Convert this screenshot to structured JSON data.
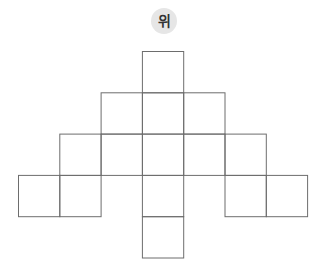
{
  "label": {
    "text": "위",
    "background": "#e6e6e6",
    "color": "#333333"
  },
  "grid": {
    "origin_x": 18.5,
    "origin_y": 51.5,
    "cell_size": 41.3,
    "stroke": "#6d6d6d",
    "cells": [
      {
        "row": 0,
        "col": 3
      },
      {
        "row": 1,
        "col": 2
      },
      {
        "row": 1,
        "col": 3
      },
      {
        "row": 1,
        "col": 4
      },
      {
        "row": 2,
        "col": 1
      },
      {
        "row": 2,
        "col": 2
      },
      {
        "row": 2,
        "col": 3
      },
      {
        "row": 2,
        "col": 4
      },
      {
        "row": 2,
        "col": 5
      },
      {
        "row": 3,
        "col": 0
      },
      {
        "row": 3,
        "col": 1
      },
      {
        "row": 3,
        "col": 3
      },
      {
        "row": 3,
        "col": 5
      },
      {
        "row": 3,
        "col": 6
      },
      {
        "row": 4,
        "col": 3
      }
    ]
  }
}
